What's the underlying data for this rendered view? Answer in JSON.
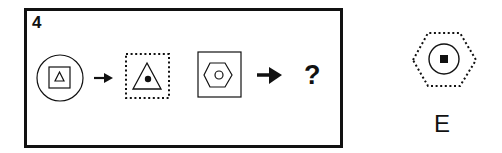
{
  "puzzle": {
    "question_number": "4",
    "question_mark": "?",
    "sequence": [
      {
        "outer": "circle",
        "inner": "square",
        "innermost": "triangle",
        "outer_style": "solid"
      },
      {
        "outer": "square",
        "inner": "triangle",
        "innermost": "filled-dot",
        "outer_style": "dotted"
      },
      {
        "outer": "square",
        "inner": "hexagon",
        "innermost": "circle",
        "outer_style": "solid"
      }
    ],
    "arrows": [
      "small-arrow",
      "large-arrow"
    ]
  },
  "option": {
    "label": "E",
    "outer": "hexagon",
    "outer_style": "dotted",
    "inner": "circle",
    "innermost": "filled-square"
  },
  "colors": {
    "stroke": "#111111",
    "background": "#ffffff"
  }
}
